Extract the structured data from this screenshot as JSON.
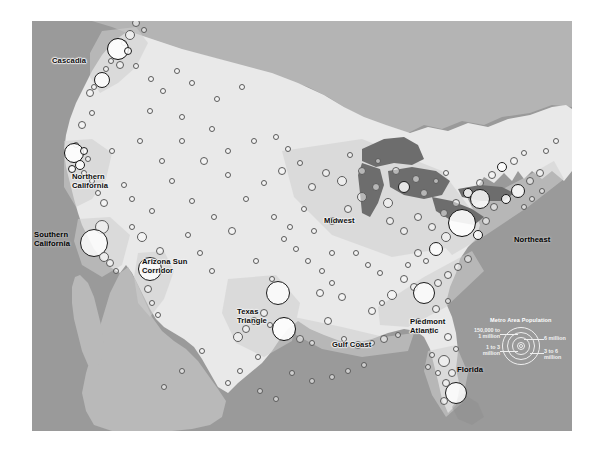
{
  "figure": {
    "kind": "map",
    "alt": "Grayscale map of the contiguous United States with proportional circles for metropolitan areas and labeled megaregions"
  },
  "regions": [
    {
      "id": "cascadia",
      "label": "Cascadia",
      "x": 20,
      "y": 36,
      "dark": false
    },
    {
      "id": "northern-california",
      "label": "Northern\nCalifornia",
      "x": 40,
      "y": 152,
      "dark": false
    },
    {
      "id": "southern-california",
      "label": "Southern\nCalifornia",
      "x": 2,
      "y": 210,
      "dark": true
    },
    {
      "id": "arizona-sun-corridor",
      "label": "Arizona Sun\nCorridor",
      "x": 110,
      "y": 237,
      "dark": false
    },
    {
      "id": "texas-triangle",
      "label": "Texas\nTriangle",
      "x": 205,
      "y": 287,
      "dark": false
    },
    {
      "id": "gulf-coast",
      "label": "Gulf Coast",
      "x": 300,
      "y": 320,
      "dark": false
    },
    {
      "id": "midwest",
      "label": "Midwest",
      "x": 292,
      "y": 196,
      "dark": false
    },
    {
      "id": "piedmont-atlantic",
      "label": "Piedmont\nAtlantic",
      "x": 378,
      "y": 297,
      "dark": false
    },
    {
      "id": "northeast",
      "label": "Northeast",
      "x": 482,
      "y": 215,
      "dark": true
    },
    {
      "id": "florida",
      "label": "Florida",
      "x": 425,
      "y": 345,
      "dark": true
    }
  ],
  "legend": {
    "title": "Metro Area Population",
    "items": [
      {
        "id": "tier-1",
        "label": "150,000 to\n1 million"
      },
      {
        "id": "tier-2",
        "label": "1 to 3\nmillion"
      },
      {
        "id": "tier-3",
        "label": "6 million"
      },
      {
        "id": "tier-4",
        "label": "3 to 6\nmillion"
      }
    ],
    "rings": [
      4.5,
      9,
      13.5,
      18
    ]
  },
  "colors": {
    "ocean": "#8d8d8d",
    "us_land": "#e9e9e9",
    "canada": "#b4b4b4",
    "mexico": "#b9b9b9",
    "lakes": "#6d6d6d",
    "megaregion": "#cfcfcf",
    "circle_stroke": "#5b5b5b",
    "label_text": "#0d0d0d",
    "legend_text": "#f2f2f2"
  },
  "metros": [
    {
      "x": 104,
      "y": 2,
      "r": 4,
      "t": "s"
    },
    {
      "x": 112,
      "y": 9,
      "r": 3,
      "t": "s"
    },
    {
      "x": 98,
      "y": 14,
      "r": 5,
      "t": "s"
    },
    {
      "x": 92,
      "y": 22,
      "r": 3,
      "t": "s"
    },
    {
      "x": 86,
      "y": 28,
      "r": 11,
      "t": "h"
    },
    {
      "x": 96,
      "y": 30,
      "r": 4,
      "t": "b"
    },
    {
      "x": 79,
      "y": 40,
      "r": 3,
      "t": "s"
    },
    {
      "x": 88,
      "y": 44,
      "r": 4,
      "t": "s"
    },
    {
      "x": 74,
      "y": 48,
      "r": 3,
      "t": "s"
    },
    {
      "x": 104,
      "y": 45,
      "r": 3,
      "t": "s"
    },
    {
      "x": 70,
      "y": 59,
      "r": 8,
      "t": "b"
    },
    {
      "x": 62,
      "y": 66,
      "r": 3,
      "t": "s"
    },
    {
      "x": 58,
      "y": 72,
      "r": 4,
      "t": "s"
    },
    {
      "x": 119,
      "y": 58,
      "r": 3,
      "t": "s"
    },
    {
      "x": 131,
      "y": 70,
      "r": 3,
      "t": "s"
    },
    {
      "x": 145,
      "y": 50,
      "r": 3,
      "t": "s"
    },
    {
      "x": 160,
      "y": 62,
      "r": 3,
      "t": "s"
    },
    {
      "x": 60,
      "y": 92,
      "r": 3,
      "t": "s"
    },
    {
      "x": 50,
      "y": 104,
      "r": 4,
      "t": "s"
    },
    {
      "x": 118,
      "y": 90,
      "r": 3,
      "t": "s"
    },
    {
      "x": 150,
      "y": 96,
      "r": 3,
      "t": "s"
    },
    {
      "x": 185,
      "y": 78,
      "r": 3,
      "t": "s"
    },
    {
      "x": 210,
      "y": 66,
      "r": 3,
      "t": "s"
    },
    {
      "x": 44,
      "y": 124,
      "r": 3,
      "t": "s"
    },
    {
      "x": 42,
      "y": 132,
      "r": 10,
      "t": "h"
    },
    {
      "x": 52,
      "y": 130,
      "r": 4,
      "t": "b"
    },
    {
      "x": 56,
      "y": 138,
      "r": 3,
      "t": "s"
    },
    {
      "x": 48,
      "y": 144,
      "r": 5,
      "t": "b"
    },
    {
      "x": 40,
      "y": 148,
      "r": 4,
      "t": "b"
    },
    {
      "x": 52,
      "y": 152,
      "r": 3,
      "t": "s"
    },
    {
      "x": 60,
      "y": 160,
      "r": 3,
      "t": "s"
    },
    {
      "x": 66,
      "y": 172,
      "r": 3,
      "t": "s"
    },
    {
      "x": 72,
      "y": 182,
      "r": 4,
      "t": "s"
    },
    {
      "x": 80,
      "y": 130,
      "r": 3,
      "t": "s"
    },
    {
      "x": 70,
      "y": 206,
      "r": 7,
      "t": "s"
    },
    {
      "x": 62,
      "y": 222,
      "r": 14,
      "t": "b"
    },
    {
      "x": 72,
      "y": 236,
      "r": 5,
      "t": "s"
    },
    {
      "x": 78,
      "y": 242,
      "r": 4,
      "t": "s"
    },
    {
      "x": 84,
      "y": 250,
      "r": 3,
      "t": "s"
    },
    {
      "x": 100,
      "y": 206,
      "r": 3,
      "t": "s"
    },
    {
      "x": 110,
      "y": 216,
      "r": 5,
      "t": "s"
    },
    {
      "x": 120,
      "y": 190,
      "r": 3,
      "t": "s"
    },
    {
      "x": 128,
      "y": 230,
      "r": 4,
      "t": "s"
    },
    {
      "x": 118,
      "y": 248,
      "r": 12,
      "t": "b"
    },
    {
      "x": 116,
      "y": 268,
      "r": 4,
      "t": "s"
    },
    {
      "x": 120,
      "y": 282,
      "r": 3,
      "t": "s"
    },
    {
      "x": 126,
      "y": 294,
      "r": 3,
      "t": "s"
    },
    {
      "x": 150,
      "y": 120,
      "r": 3,
      "t": "s"
    },
    {
      "x": 172,
      "y": 140,
      "r": 4,
      "t": "s"
    },
    {
      "x": 196,
      "y": 130,
      "r": 3,
      "t": "s"
    },
    {
      "x": 160,
      "y": 180,
      "r": 3,
      "t": "s"
    },
    {
      "x": 182,
      "y": 196,
      "r": 3,
      "t": "s"
    },
    {
      "x": 200,
      "y": 210,
      "r": 4,
      "t": "s"
    },
    {
      "x": 214,
      "y": 178,
      "r": 3,
      "t": "s"
    },
    {
      "x": 232,
      "y": 162,
      "r": 3,
      "t": "s"
    },
    {
      "x": 250,
      "y": 150,
      "r": 4,
      "t": "s"
    },
    {
      "x": 242,
      "y": 196,
      "r": 3,
      "t": "s"
    },
    {
      "x": 258,
      "y": 206,
      "r": 3,
      "t": "s"
    },
    {
      "x": 272,
      "y": 188,
      "r": 3,
      "t": "s"
    },
    {
      "x": 224,
      "y": 240,
      "r": 3,
      "t": "s"
    },
    {
      "x": 240,
      "y": 258,
      "r": 3,
      "t": "s"
    },
    {
      "x": 246,
      "y": 272,
      "r": 12,
      "t": "b"
    },
    {
      "x": 232,
      "y": 292,
      "r": 4,
      "t": "s"
    },
    {
      "x": 222,
      "y": 300,
      "r": 4,
      "t": "s"
    },
    {
      "x": 214,
      "y": 308,
      "r": 4,
      "t": "s"
    },
    {
      "x": 206,
      "y": 316,
      "r": 5,
      "t": "s"
    },
    {
      "x": 238,
      "y": 304,
      "r": 3,
      "t": "s"
    },
    {
      "x": 252,
      "y": 308,
      "r": 12,
      "t": "h"
    },
    {
      "x": 268,
      "y": 318,
      "r": 4,
      "t": "s"
    },
    {
      "x": 280,
      "y": 322,
      "r": 3,
      "t": "s"
    },
    {
      "x": 226,
      "y": 336,
      "r": 3,
      "t": "s"
    },
    {
      "x": 208,
      "y": 350,
      "r": 3,
      "t": "s"
    },
    {
      "x": 196,
      "y": 362,
      "r": 3,
      "t": "s"
    },
    {
      "x": 290,
      "y": 250,
      "r": 3,
      "t": "s"
    },
    {
      "x": 300,
      "y": 262,
      "r": 3,
      "t": "s"
    },
    {
      "x": 310,
      "y": 276,
      "r": 4,
      "t": "s"
    },
    {
      "x": 296,
      "y": 300,
      "r": 4,
      "t": "s"
    },
    {
      "x": 312,
      "y": 318,
      "r": 3,
      "t": "s"
    },
    {
      "x": 326,
      "y": 324,
      "r": 4,
      "t": "s"
    },
    {
      "x": 340,
      "y": 322,
      "r": 3,
      "t": "s"
    },
    {
      "x": 352,
      "y": 318,
      "r": 4,
      "t": "s"
    },
    {
      "x": 366,
      "y": 314,
      "r": 3,
      "t": "s"
    },
    {
      "x": 282,
      "y": 210,
      "r": 3,
      "t": "s"
    },
    {
      "x": 300,
      "y": 200,
      "r": 4,
      "t": "s"
    },
    {
      "x": 316,
      "y": 188,
      "r": 4,
      "t": "s"
    },
    {
      "x": 330,
      "y": 176,
      "r": 5,
      "t": "s"
    },
    {
      "x": 344,
      "y": 166,
      "r": 4,
      "t": "s"
    },
    {
      "x": 356,
      "y": 182,
      "r": 5,
      "t": "s"
    },
    {
      "x": 330,
      "y": 150,
      "r": 4,
      "t": "s"
    },
    {
      "x": 346,
      "y": 140,
      "r": 3,
      "t": "s"
    },
    {
      "x": 318,
      "y": 134,
      "r": 3,
      "t": "s"
    },
    {
      "x": 310,
      "y": 160,
      "r": 5,
      "t": "s"
    },
    {
      "x": 294,
      "y": 152,
      "r": 4,
      "t": "s"
    },
    {
      "x": 280,
      "y": 166,
      "r": 4,
      "t": "s"
    },
    {
      "x": 268,
      "y": 142,
      "r": 3,
      "t": "s"
    },
    {
      "x": 256,
      "y": 128,
      "r": 3,
      "t": "s"
    },
    {
      "x": 244,
      "y": 116,
      "r": 3,
      "t": "s"
    },
    {
      "x": 364,
      "y": 150,
      "r": 4,
      "t": "s"
    },
    {
      "x": 372,
      "y": 166,
      "r": 6,
      "t": "b"
    },
    {
      "x": 384,
      "y": 158,
      "r": 4,
      "t": "s"
    },
    {
      "x": 392,
      "y": 172,
      "r": 4,
      "t": "s"
    },
    {
      "x": 404,
      "y": 160,
      "r": 3,
      "t": "s"
    },
    {
      "x": 414,
      "y": 152,
      "r": 3,
      "t": "s"
    },
    {
      "x": 358,
      "y": 200,
      "r": 4,
      "t": "s"
    },
    {
      "x": 372,
      "y": 210,
      "r": 4,
      "t": "s"
    },
    {
      "x": 386,
      "y": 196,
      "r": 4,
      "t": "s"
    },
    {
      "x": 400,
      "y": 206,
      "r": 4,
      "t": "s"
    },
    {
      "x": 412,
      "y": 192,
      "r": 4,
      "t": "s"
    },
    {
      "x": 424,
      "y": 182,
      "r": 4,
      "t": "s"
    },
    {
      "x": 436,
      "y": 172,
      "r": 5,
      "t": "b"
    },
    {
      "x": 448,
      "y": 162,
      "r": 4,
      "t": "s"
    },
    {
      "x": 460,
      "y": 154,
      "r": 4,
      "t": "s"
    },
    {
      "x": 470,
      "y": 146,
      "r": 5,
      "t": "b"
    },
    {
      "x": 482,
      "y": 140,
      "r": 4,
      "t": "s"
    },
    {
      "x": 492,
      "y": 132,
      "r": 3,
      "t": "s"
    },
    {
      "x": 448,
      "y": 178,
      "r": 10,
      "t": "b"
    },
    {
      "x": 462,
      "y": 186,
      "r": 4,
      "t": "s"
    },
    {
      "x": 474,
      "y": 178,
      "r": 5,
      "t": "b"
    },
    {
      "x": 486,
      "y": 170,
      "r": 7,
      "t": "b"
    },
    {
      "x": 498,
      "y": 160,
      "r": 4,
      "t": "s"
    },
    {
      "x": 508,
      "y": 152,
      "r": 4,
      "t": "s"
    },
    {
      "x": 492,
      "y": 186,
      "r": 3,
      "t": "s"
    },
    {
      "x": 500,
      "y": 178,
      "r": 3,
      "t": "s"
    },
    {
      "x": 510,
      "y": 170,
      "r": 3,
      "t": "s"
    },
    {
      "x": 430,
      "y": 202,
      "r": 14,
      "t": "h"
    },
    {
      "x": 446,
      "y": 214,
      "r": 5,
      "t": "b"
    },
    {
      "x": 454,
      "y": 200,
      "r": 4,
      "t": "s"
    },
    {
      "x": 414,
      "y": 216,
      "r": 5,
      "t": "s"
    },
    {
      "x": 404,
      "y": 228,
      "r": 7,
      "t": "b"
    },
    {
      "x": 394,
      "y": 240,
      "r": 3,
      "t": "s"
    },
    {
      "x": 386,
      "y": 232,
      "r": 4,
      "t": "s"
    },
    {
      "x": 376,
      "y": 244,
      "r": 3,
      "t": "s"
    },
    {
      "x": 372,
      "y": 258,
      "r": 4,
      "t": "s"
    },
    {
      "x": 382,
      "y": 266,
      "r": 4,
      "t": "s"
    },
    {
      "x": 392,
      "y": 272,
      "r": 11,
      "t": "b"
    },
    {
      "x": 406,
      "y": 262,
      "r": 4,
      "t": "s"
    },
    {
      "x": 416,
      "y": 254,
      "r": 4,
      "t": "s"
    },
    {
      "x": 426,
      "y": 246,
      "r": 4,
      "t": "s"
    },
    {
      "x": 436,
      "y": 238,
      "r": 4,
      "t": "s"
    },
    {
      "x": 360,
      "y": 274,
      "r": 5,
      "t": "s"
    },
    {
      "x": 350,
      "y": 282,
      "r": 3,
      "t": "s"
    },
    {
      "x": 340,
      "y": 290,
      "r": 4,
      "t": "s"
    },
    {
      "x": 404,
      "y": 288,
      "r": 4,
      "t": "s"
    },
    {
      "x": 416,
      "y": 280,
      "r": 3,
      "t": "s"
    },
    {
      "x": 386,
      "y": 300,
      "r": 3,
      "t": "s"
    },
    {
      "x": 398,
      "y": 310,
      "r": 3,
      "t": "s"
    },
    {
      "x": 416,
      "y": 316,
      "r": 4,
      "t": "s"
    },
    {
      "x": 424,
      "y": 328,
      "r": 3,
      "t": "s"
    },
    {
      "x": 412,
      "y": 340,
      "r": 6,
      "t": "s"
    },
    {
      "x": 420,
      "y": 352,
      "r": 4,
      "t": "s"
    },
    {
      "x": 414,
      "y": 362,
      "r": 4,
      "t": "s"
    },
    {
      "x": 424,
      "y": 372,
      "r": 11,
      "t": "b"
    },
    {
      "x": 412,
      "y": 380,
      "r": 4,
      "t": "s"
    },
    {
      "x": 406,
      "y": 352,
      "r": 3,
      "t": "s"
    },
    {
      "x": 400,
      "y": 334,
      "r": 3,
      "t": "s"
    },
    {
      "x": 396,
      "y": 346,
      "r": 3,
      "t": "s"
    },
    {
      "x": 324,
      "y": 232,
      "r": 3,
      "t": "s"
    },
    {
      "x": 336,
      "y": 244,
      "r": 3,
      "t": "s"
    },
    {
      "x": 348,
      "y": 252,
      "r": 3,
      "t": "s"
    },
    {
      "x": 300,
      "y": 232,
      "r": 3,
      "t": "s"
    },
    {
      "x": 288,
      "y": 272,
      "r": 4,
      "t": "s"
    },
    {
      "x": 276,
      "y": 240,
      "r": 3,
      "t": "s"
    },
    {
      "x": 264,
      "y": 228,
      "r": 3,
      "t": "s"
    },
    {
      "x": 252,
      "y": 218,
      "r": 3,
      "t": "s"
    },
    {
      "x": 180,
      "y": 250,
      "r": 3,
      "t": "s"
    },
    {
      "x": 168,
      "y": 232,
      "r": 3,
      "t": "s"
    },
    {
      "x": 156,
      "y": 214,
      "r": 3,
      "t": "s"
    },
    {
      "x": 196,
      "y": 154,
      "r": 3,
      "t": "s"
    },
    {
      "x": 222,
      "y": 120,
      "r": 3,
      "t": "s"
    },
    {
      "x": 180,
      "y": 108,
      "r": 3,
      "t": "s"
    },
    {
      "x": 140,
      "y": 160,
      "r": 3,
      "t": "s"
    },
    {
      "x": 130,
      "y": 140,
      "r": 3,
      "t": "s"
    },
    {
      "x": 108,
      "y": 120,
      "r": 3,
      "t": "s"
    },
    {
      "x": 92,
      "y": 164,
      "r": 3,
      "t": "s"
    },
    {
      "x": 100,
      "y": 178,
      "r": 3,
      "t": "s"
    },
    {
      "x": 170,
      "y": 330,
      "r": 3,
      "t": "s"
    },
    {
      "x": 150,
      "y": 350,
      "r": 3,
      "t": "s"
    },
    {
      "x": 132,
      "y": 366,
      "r": 3,
      "t": "s"
    },
    {
      "x": 260,
      "y": 352,
      "r": 3,
      "t": "s"
    },
    {
      "x": 280,
      "y": 360,
      "r": 3,
      "t": "s"
    },
    {
      "x": 300,
      "y": 356,
      "r": 3,
      "t": "s"
    },
    {
      "x": 316,
      "y": 350,
      "r": 3,
      "t": "s"
    },
    {
      "x": 332,
      "y": 344,
      "r": 3,
      "t": "s"
    },
    {
      "x": 228,
      "y": 370,
      "r": 3,
      "t": "s"
    },
    {
      "x": 244,
      "y": 378,
      "r": 3,
      "t": "s"
    },
    {
      "x": 514,
      "y": 130,
      "r": 3,
      "t": "s"
    },
    {
      "x": 524,
      "y": 120,
      "r": 3,
      "t": "s"
    }
  ]
}
